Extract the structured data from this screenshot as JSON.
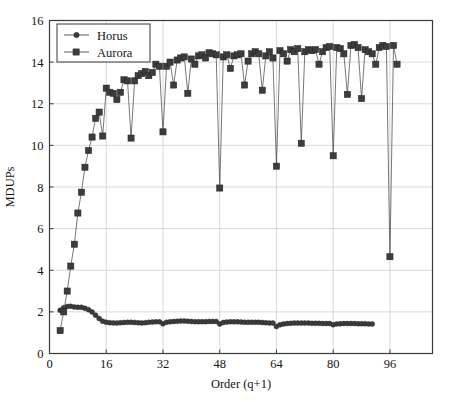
{
  "chart_data": {
    "type": "line",
    "title": "",
    "xlabel": "Order (q+1)",
    "ylabel": "MDUPs",
    "xlim": [
      0,
      108
    ],
    "ylim": [
      0,
      16
    ],
    "xticks": [
      0,
      16,
      32,
      48,
      64,
      80,
      96
    ],
    "yticks": [
      0,
      2,
      4,
      6,
      8,
      10,
      12,
      14,
      16
    ],
    "grid": true,
    "legend_position": "upper-left",
    "marker_color": "#3c3c3c",
    "line_color": "#4a4a4a",
    "grid_color": "#c9c9c9",
    "frame_color": "#3a3a3a",
    "series": [
      {
        "name": "Horus",
        "marker": "circle",
        "x": [
          3,
          4,
          5,
          6,
          7,
          8,
          9,
          10,
          11,
          12,
          13,
          14,
          15,
          16,
          17,
          18,
          19,
          20,
          21,
          22,
          23,
          24,
          25,
          26,
          27,
          28,
          29,
          30,
          31,
          32,
          33,
          34,
          35,
          36,
          37,
          38,
          39,
          40,
          41,
          42,
          43,
          44,
          45,
          46,
          47,
          48,
          49,
          50,
          51,
          52,
          53,
          54,
          55,
          56,
          57,
          58,
          59,
          60,
          61,
          62,
          63,
          64,
          65,
          66,
          67,
          68,
          69,
          70,
          71,
          72,
          73,
          74,
          75,
          76,
          77,
          78,
          79,
          80,
          81,
          82,
          83,
          84,
          85,
          86,
          87,
          88,
          89,
          90,
          91
        ],
        "values": [
          2.08,
          2.2,
          2.26,
          2.27,
          2.24,
          2.22,
          2.22,
          2.17,
          2.1,
          2.0,
          1.84,
          1.68,
          1.55,
          1.5,
          1.48,
          1.47,
          1.47,
          1.48,
          1.49,
          1.5,
          1.5,
          1.49,
          1.48,
          1.47,
          1.48,
          1.5,
          1.51,
          1.52,
          1.52,
          1.43,
          1.5,
          1.52,
          1.54,
          1.55,
          1.56,
          1.56,
          1.55,
          1.54,
          1.53,
          1.53,
          1.53,
          1.53,
          1.54,
          1.54,
          1.54,
          1.42,
          1.49,
          1.51,
          1.52,
          1.52,
          1.52,
          1.51,
          1.5,
          1.5,
          1.5,
          1.5,
          1.5,
          1.49,
          1.48,
          1.47,
          1.46,
          1.3,
          1.38,
          1.42,
          1.44,
          1.45,
          1.46,
          1.46,
          1.46,
          1.46,
          1.46,
          1.45,
          1.45,
          1.45,
          1.44,
          1.44,
          1.44,
          1.38,
          1.42,
          1.43,
          1.44,
          1.44,
          1.44,
          1.44,
          1.43,
          1.43,
          1.43,
          1.42,
          1.42
        ]
      },
      {
        "name": "Aurora",
        "marker": "square",
        "x": [
          3,
          4,
          5,
          6,
          7,
          8,
          9,
          10,
          11,
          12,
          13,
          14,
          15,
          16,
          17,
          18,
          19,
          20,
          21,
          22,
          23,
          24,
          25,
          26,
          27,
          28,
          29,
          30,
          31,
          32,
          33,
          34,
          35,
          36,
          37,
          38,
          39,
          40,
          41,
          42,
          43,
          44,
          45,
          46,
          47,
          48,
          49,
          50,
          51,
          52,
          53,
          54,
          55,
          56,
          57,
          58,
          59,
          60,
          61,
          62,
          63,
          64,
          65,
          66,
          67,
          68,
          69,
          70,
          71,
          72,
          73,
          74,
          75,
          76,
          77,
          78,
          79,
          80,
          81,
          82,
          83,
          84,
          85,
          86,
          87,
          88,
          89,
          90,
          91,
          92,
          93,
          94,
          95,
          96,
          97,
          98
        ],
        "values": [
          1.1,
          2.0,
          3.0,
          4.2,
          5.25,
          6.75,
          7.75,
          8.95,
          9.75,
          10.4,
          11.3,
          11.6,
          10.45,
          12.75,
          12.55,
          12.5,
          12.2,
          12.55,
          13.15,
          13.1,
          10.35,
          13.1,
          13.35,
          13.45,
          13.55,
          13.35,
          13.5,
          13.9,
          13.8,
          10.65,
          13.8,
          14.0,
          12.9,
          14.1,
          14.2,
          14.25,
          12.5,
          14.15,
          13.9,
          14.3,
          14.35,
          14.2,
          14.45,
          14.4,
          14.35,
          7.95,
          14.25,
          14.35,
          13.7,
          14.3,
          14.35,
          14.4,
          12.9,
          14.05,
          14.4,
          14.5,
          14.4,
          12.65,
          14.3,
          14.5,
          14.2,
          9.0,
          14.55,
          14.4,
          14.05,
          14.6,
          14.5,
          14.65,
          10.1,
          14.5,
          14.6,
          14.55,
          14.6,
          13.9,
          14.5,
          14.7,
          14.75,
          9.5,
          14.7,
          14.65,
          14.4,
          12.45,
          14.8,
          14.85,
          14.7,
          12.25,
          14.6,
          14.5,
          14.4,
          13.9,
          14.7,
          14.8,
          14.75,
          4.65,
          14.8,
          13.9
        ]
      }
    ]
  },
  "legend": {
    "entries": [
      {
        "label": "Horus",
        "marker": "circle"
      },
      {
        "label": "Aurora",
        "marker": "square"
      }
    ]
  },
  "axes": {
    "x_title": "Order (q+1)",
    "y_title": "MDUPs",
    "x_tick_labels": [
      "0",
      "16",
      "32",
      "48",
      "64",
      "80",
      "96"
    ],
    "y_tick_labels": [
      "0",
      "2",
      "4",
      "6",
      "8",
      "10",
      "12",
      "14",
      "16"
    ]
  }
}
